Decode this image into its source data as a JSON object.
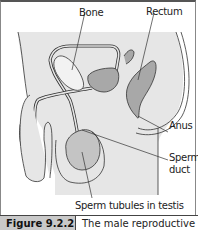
{
  "figure": {
    "labels": {
      "bone": "Bone",
      "rectum": "Rectum",
      "anus": "Anus",
      "sperm_duct_line1": "Sperm",
      "sperm_duct_line2": "duct",
      "sperm_tubules": "Sperm tubules in testis"
    },
    "caption": {
      "number": "Figure 9.2.2",
      "text": "The male reproductive"
    },
    "colors": {
      "body_fill": "#e6e6e6",
      "organ_fill": "#a8a8a8",
      "bone_fill": "#f2f2f2",
      "testis_fill": "#c4c4c4",
      "outline": "#333333",
      "caption_bg": "#c9c9c9"
    }
  }
}
